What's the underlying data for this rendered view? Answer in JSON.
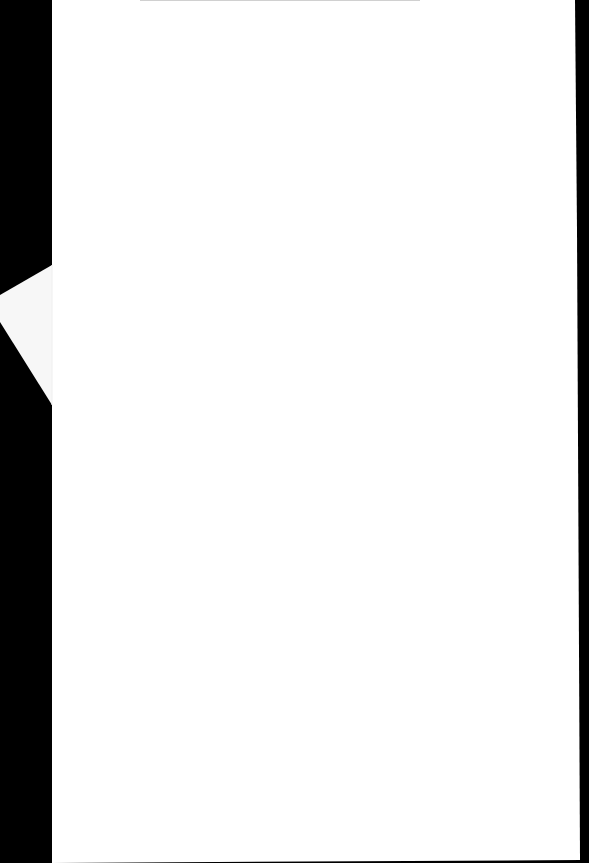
{
  "scene": {
    "description": "Blank white sheet of paper photographed on a black background",
    "background_color": "#000000",
    "paper_color": "#ffffff",
    "corner_fold_color": "#f7f7f7",
    "text_content": ""
  }
}
